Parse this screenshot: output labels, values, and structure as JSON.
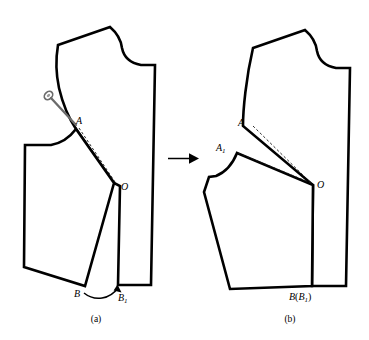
{
  "figure": {
    "background_color": "#ffffff",
    "line_color": "#000000",
    "construction_color": "#1a1a1a",
    "pin_color": "#6b6b6b",
    "captions": {
      "left": "(a)",
      "right": "(b)"
    }
  },
  "panel_a": {
    "caption": "(a)",
    "labels": {
      "A": "A",
      "O": "O",
      "B": "B",
      "B1_main": "B",
      "B1_sub": "1"
    },
    "annotations": {
      "pin": "awl-pin-icon",
      "rotation_arrow": "curved-rotation-arrow",
      "dashed_ao": "dashed-line-A-to-O"
    }
  },
  "panel_b": {
    "caption": "(b)",
    "labels": {
      "A": "A",
      "A1_main": "A",
      "A1_sub": "1",
      "O": "O",
      "B_combined_main": "B",
      "B_combined_open": "(",
      "B_combined_sub_main": "B",
      "B_combined_sub": "1",
      "B_combined_close": ")"
    },
    "annotations": {
      "dashed_ao": "dashed-line-A-to-O",
      "dashed_a1o": "dashed-line-A1-to-O"
    }
  },
  "transition": {
    "arrow": "right-arrow-icon"
  }
}
